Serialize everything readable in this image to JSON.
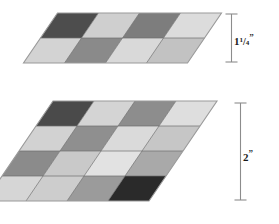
{
  "page": {
    "background": "#ffffff",
    "width": 279,
    "height": 224
  },
  "diagram": {
    "outline_color": "#9a9a9a",
    "grid_line_color": "#6f6f6f",
    "dimension_line_color": "#8c8c8c"
  },
  "figures": [
    {
      "id": "top-figure",
      "name": "small-parallelogram",
      "rows": 2,
      "cols": 4,
      "cells": [
        [
          "#4d4d4d",
          "#cfcfcf",
          "#7d7d7d",
          "#dcdcdc"
        ],
        [
          "#d3d3d3",
          "#8a8a8a",
          "#d9d9d9",
          "#c2c2c2"
        ]
      ],
      "dimension": {
        "id": "dim-top",
        "whole": "1",
        "numerator": "1",
        "denominator": "4",
        "unit": "”",
        "full_text": "1 1/4”"
      }
    },
    {
      "id": "bottom-figure",
      "name": "large-parallelogram",
      "rows": 4,
      "cols": 4,
      "cells": [
        [
          "#4a4a4a",
          "#d4d4d4",
          "#8d8d8d",
          "#dedede"
        ],
        [
          "#d2d2d2",
          "#8f8f8f",
          "#dadada",
          "#c6c6c6"
        ],
        [
          "#8b8b8b",
          "#c9c9c9",
          "#e2e2e2",
          "#a9a9a9"
        ],
        [
          "#d6d6d6",
          "#cdcdcd",
          "#9b9b9b",
          "#2a2a2a"
        ]
      ],
      "dimension": {
        "id": "dim-bottom",
        "whole": "2",
        "numerator": "",
        "denominator": "",
        "unit": "”",
        "full_text": "2”"
      }
    }
  ]
}
